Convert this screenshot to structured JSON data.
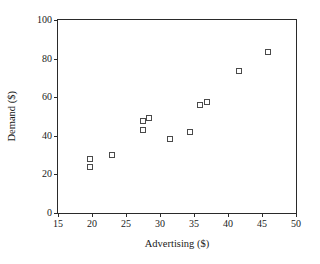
{
  "chart_data": {
    "type": "scatter",
    "title": "",
    "xlabel": "Advertising ($)",
    "ylabel": "Demand ($)",
    "xlim": [
      15,
      50
    ],
    "ylim": [
      0,
      100
    ],
    "xticks": [
      15,
      20,
      25,
      30,
      35,
      40,
      45,
      50
    ],
    "yticks": [
      0,
      20,
      40,
      60,
      80,
      100
    ],
    "xtick_labels": [
      "15",
      "20",
      "25",
      "30",
      "35",
      "40",
      "45",
      "50"
    ],
    "ytick_labels": [
      "0",
      "20",
      "40",
      "60",
      "80",
      "100"
    ],
    "grid": false,
    "legend": null,
    "marker": "open-square",
    "marker_color": "#4a4a4a",
    "points": [
      {
        "x": 19.7,
        "y": 28.2
      },
      {
        "x": 19.7,
        "y": 23.6
      },
      {
        "x": 23.0,
        "y": 30.3
      },
      {
        "x": 27.5,
        "y": 47.7
      },
      {
        "x": 27.5,
        "y": 43.1
      },
      {
        "x": 28.4,
        "y": 49.2
      },
      {
        "x": 31.5,
        "y": 38.5
      },
      {
        "x": 34.4,
        "y": 42.1
      },
      {
        "x": 35.9,
        "y": 55.9
      },
      {
        "x": 36.9,
        "y": 57.4
      },
      {
        "x": 41.6,
        "y": 73.8
      },
      {
        "x": 45.9,
        "y": 83.6
      }
    ]
  }
}
